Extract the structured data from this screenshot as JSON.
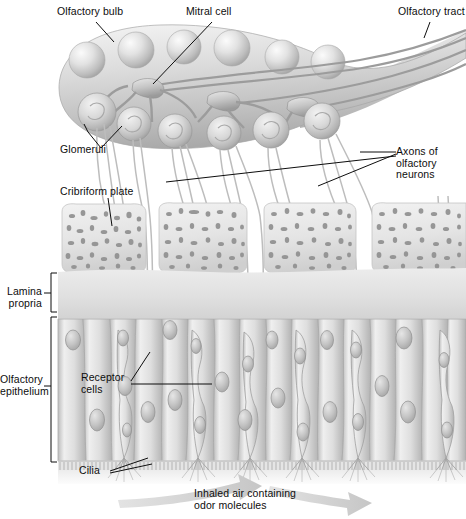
{
  "figure": {
    "background_color": "#ffffff",
    "ink_color": "#0d0d0d",
    "tissue_light": "#efefef",
    "tissue_mid": "#c9c9c9",
    "tissue_dark": "#8f8f8f",
    "arrow_color": "#cfcfcf"
  },
  "labels": {
    "olfactory_bulb": "Olfactory bulb",
    "mitral_cell": "Mitral cell",
    "olfactory_tract": "Olfactory tract",
    "glomeruli": "Glomeruli",
    "axons_of_olfactory_neurons": "Axons of\nolfactory\nneurons",
    "cribriform_plate": "Cribriform plate",
    "lamina_propria": "Lamina\npropria",
    "olfactory_epithelium": "Olfactory\nepithelium",
    "receptor_cells": "Receptor\ncells",
    "cilia": "Cilia",
    "inhaled_air": "Inhaled air containing\nodor molecules"
  },
  "structures": {
    "olfactory_bulb": {
      "name": "olfactory-bulb",
      "description": "Teardrop shaped bulb tapering right into the olfactory tract"
    },
    "mitral_cells": {
      "name": "mitral-cell",
      "count": 3,
      "description": "Branched neurons inside the bulb whose dendrites contact glomeruli"
    },
    "glomeruli": {
      "name": "glomerulus",
      "count": 6,
      "description": "Spherical synaptic clusters along the lower border of the bulb"
    },
    "bulb_spheres": {
      "name": "bulb-sphere",
      "count": 6,
      "description": "Row of round cell bodies in the upper bulb"
    },
    "cribriform_plate": {
      "name": "cribriform-plate-block",
      "count": 4,
      "description": "Four spongy bone blocks perforated by axon bundles"
    },
    "axon_bundles": {
      "name": "axon-bundle",
      "count": 6,
      "description": "Bundles of olfactory neuron axons passing through the cribriform plate"
    },
    "epithelial_cells": {
      "name": "epithelial-cell",
      "count": 16,
      "description": "Columnar cells of the olfactory epithelium with oval nuclei"
    },
    "cilia": {
      "name": "cilia-tuft",
      "count": 6,
      "description": "Hair-like cilia projecting from the apical surface into the mucus"
    },
    "airflow_arrows": {
      "name": "airflow-arrow",
      "count": 2,
      "direction": "left-to-right"
    }
  }
}
